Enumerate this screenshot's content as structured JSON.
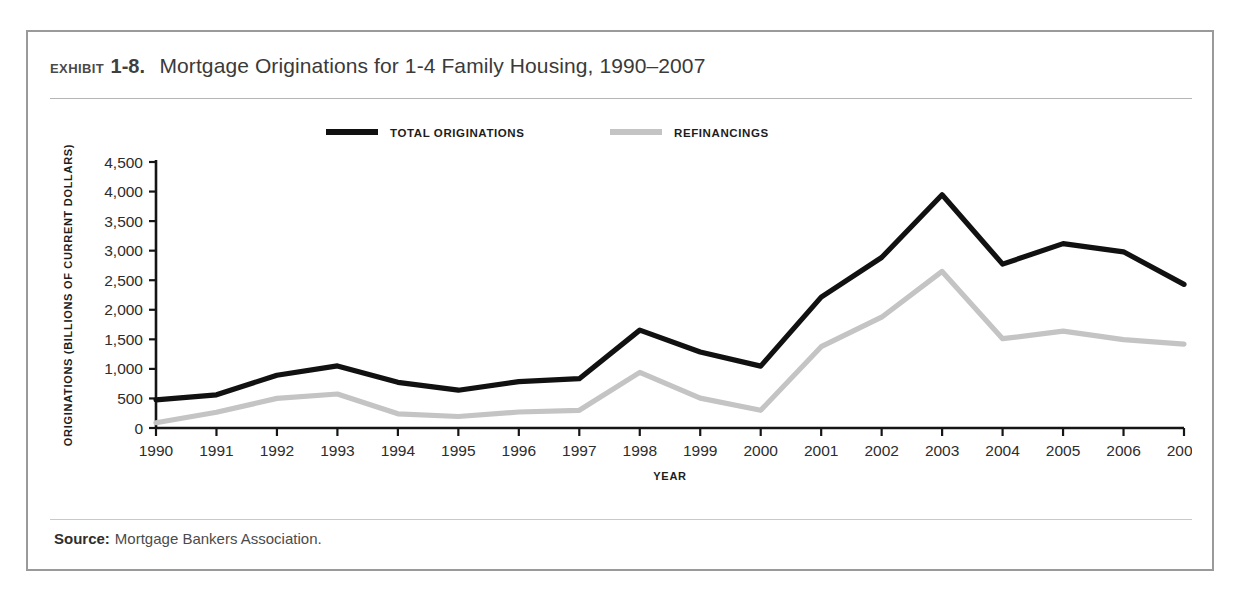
{
  "exhibit": {
    "label": "Exhibit",
    "number": "1-8.",
    "title": "Mortgage Originations for 1-4 Family Housing, 1990–2007"
  },
  "source": {
    "label": "Source:",
    "text": "Mortgage Bankers Association."
  },
  "chart_data": {
    "type": "line",
    "title": "Mortgage Originations for 1-4 Family Housing, 1990–2007",
    "xlabel": "YEAR",
    "ylabel": "ORIGINATIONS (BILLIONS OF CURRENT DOLLARS)",
    "categories": [
      "1990",
      "1991",
      "1992",
      "1993",
      "1994",
      "1995",
      "1996",
      "1997",
      "1998",
      "1999",
      "2000",
      "2001",
      "2002",
      "2003",
      "2004",
      "2005",
      "2006",
      "2007"
    ],
    "ylim": [
      0,
      4500
    ],
    "ytick_labels": [
      "0",
      "500",
      "1,000",
      "1,500",
      "2,000",
      "2,500",
      "3,000",
      "3,500",
      "4,000",
      "4,500"
    ],
    "ytick_values": [
      0,
      500,
      1000,
      1500,
      2000,
      2500,
      3000,
      3500,
      4000,
      4500
    ],
    "grid": false,
    "legend_position": "top-center",
    "series": [
      {
        "name": "TOTAL ORIGINATIONS",
        "color": "#111111",
        "values": [
          475,
          562,
          894,
          1050,
          773,
          640,
          785,
          834,
          1656,
          1286,
          1048,
          2215,
          2885,
          3945,
          2773,
          3120,
          2980,
          2430
        ]
      },
      {
        "name": "REFINANCINGS",
        "color": "#c4c4c4",
        "values": [
          90,
          265,
          500,
          575,
          240,
          195,
          270,
          300,
          940,
          505,
          300,
          1375,
          1875,
          2650,
          1510,
          1640,
          1495,
          1420
        ]
      }
    ]
  }
}
